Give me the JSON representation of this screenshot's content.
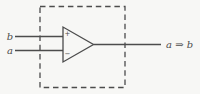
{
  "diagram": {
    "type": "logic-comparator-figure",
    "inputs": {
      "top_label": "b",
      "bottom_label": "a"
    },
    "gate": {
      "plus_label": "+",
      "minus_label": "−"
    },
    "output_label": "a ⇒ b"
  },
  "colors": {
    "line": "#4c4c4c",
    "background": "#f7f7f5"
  }
}
